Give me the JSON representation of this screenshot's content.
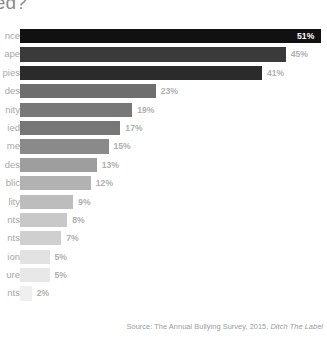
{
  "title": "re bullied?",
  "source": {
    "prefix": "Source: The Annual Bullying Survey, 2015, ",
    "publisher": "Ditch The Label"
  },
  "colors": {
    "background": "#ffffff",
    "title": "#8c8c8c",
    "label": "#a8a8a8",
    "value_outside": "#b0b0b0",
    "value_inside": "#ffffff",
    "source": "#9a9a9a"
  },
  "chart_data": {
    "type": "bar",
    "orientation": "horizontal",
    "title": "re bullied?",
    "xlabel": "",
    "ylabel": "",
    "xlim": [
      0,
      52
    ],
    "grid": false,
    "legend": null,
    "value_suffix": "%",
    "note": "Left category labels are clipped by the image crop; only word endings are visible.",
    "categories": [
      "nce",
      "ape",
      "pies",
      "des",
      "nity",
      "ied",
      "me",
      "des",
      "blic",
      "lity",
      "nts",
      "nts",
      "ion",
      "ure",
      "nts"
    ],
    "values": [
      51,
      45,
      41,
      23,
      19,
      17,
      15,
      13,
      12,
      9,
      8,
      7,
      5,
      5,
      2
    ],
    "value_labels": [
      "51%",
      "45%",
      "41%",
      "23%",
      "19%",
      "17%",
      "15%",
      "13%",
      "12%",
      "9%",
      "8%",
      "7%",
      "5%",
      "5%",
      "2%"
    ],
    "bar_colors": [
      "#111111",
      "#3a3a3a",
      "#2b2b2b",
      "#6e6e6e",
      "#787878",
      "#767676",
      "#8a8a8a",
      "#9e9e9e",
      "#b2b2b2",
      "#bdbdbd",
      "#c8c8c8",
      "#cfcfcf",
      "#e2e2e2",
      "#e8e8e8",
      "#efefef"
    ],
    "label_position": [
      "inside",
      "outside",
      "outside",
      "outside",
      "outside",
      "outside",
      "outside",
      "outside",
      "outside",
      "outside",
      "outside",
      "outside",
      "outside",
      "outside",
      "outside"
    ]
  }
}
